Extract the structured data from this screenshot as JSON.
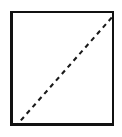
{
  "figure": {
    "canvas": {
      "width": 122,
      "height": 137,
      "background_color": "#ffffff"
    },
    "square": {
      "name": "square-outline",
      "x": 10,
      "y": 11,
      "width": 104,
      "height": 115,
      "fill_color": "#ffffff",
      "border_color": "#111111",
      "border_width": 3,
      "border_style": "solid"
    },
    "diagonal": {
      "name": "dashed-diagonal",
      "from_corner": "bottom-left",
      "to_corner": "top-right",
      "x1": 2,
      "y1": 113,
      "x2": 101,
      "y2": 2,
      "color": "#1a1a1a",
      "line_width": 2.1,
      "line_style": "dashed",
      "dash_length": 4.6,
      "gap_length": 4.2
    }
  },
  "chart_data": {
    "type": "line",
    "title": "",
    "xlabel": "",
    "ylabel": "",
    "xlim": [
      0,
      1
    ],
    "ylim": [
      0,
      1
    ],
    "grid": false,
    "legend": "none",
    "frame": {
      "visible": true,
      "color": "#111111",
      "linewidth": 3
    },
    "series": [
      {
        "name": "identity-diagonal",
        "style": "dashed",
        "color": "#1a1a1a",
        "x": [
          0,
          1
        ],
        "y": [
          0,
          1
        ]
      }
    ]
  }
}
